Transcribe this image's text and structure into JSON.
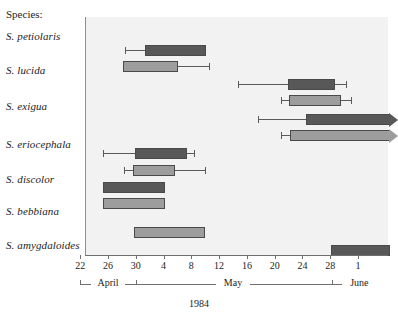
{
  "legend": {
    "species_header": "Species:"
  },
  "axis": {
    "xlabel": "1984",
    "tick_labels": [
      "22",
      "26",
      "30",
      "4",
      "8",
      "12",
      "16",
      "20",
      "24",
      "28",
      "1"
    ],
    "months": [
      {
        "name": "April",
        "start_label": "22",
        "end_label": "30"
      },
      {
        "name": "May",
        "start_label": "1",
        "end_label": "31"
      },
      {
        "name": "June",
        "start_label": "1",
        "end_label": "1"
      }
    ]
  },
  "colors": {
    "dark_bar": "#585858",
    "light_bar": "#9d9d9d",
    "plot_background": "#f2f2f2",
    "axis": "#6f6f6f"
  },
  "chart_data": {
    "type": "bar",
    "title": "",
    "subtitle": "",
    "xlabel": "1984",
    "ylabel": "Species:",
    "xlim": [
      "1984-04-22",
      "1984-06-02"
    ],
    "x_tick_labels": [
      "22",
      "26",
      "30",
      "4",
      "8",
      "12",
      "16",
      "20",
      "24",
      "28",
      "1"
    ],
    "x_tick_days": [
      0,
      4,
      8,
      12,
      16,
      20,
      24,
      28,
      32,
      36,
      40
    ],
    "grid": false,
    "legend_position": "none",
    "note": "Day 0 = April 22, 1984. Two bars per species: upper = dark series, lower = light series. Bars are box ranges; thin lines are whiskers. Arrow = range extends beyond right axis limit.",
    "categories": [
      "S. petiolaris",
      "S. lucida",
      "S. exigua",
      "S. eriocephala",
      "S. discolor",
      "S. bebbiana",
      "S. amygdaloides"
    ],
    "series": [
      {
        "name": "dark",
        "color": "#585858",
        "bars": [
          {
            "category": "S. petiolaris",
            "box_start": 9.2,
            "box_end": 17.9,
            "whisker_low": 6.3,
            "whisker_high": 17.9,
            "arrow_right": false
          },
          {
            "category": "S. lucida",
            "box_start": 29.8,
            "box_end": 36.5,
            "whisker_low": 22.6,
            "whisker_high": 38.2,
            "arrow_right": false
          },
          {
            "category": "S. exigua",
            "box_start": 32.3,
            "box_end": 44.4,
            "whisker_low": 25.5,
            "whisker_high": 44.4,
            "arrow_right": true
          },
          {
            "category": "S. eriocephala",
            "box_start": 7.8,
            "box_end": 15.3,
            "whisker_low": 3.1,
            "whisker_high": 16.2,
            "arrow_right": false
          },
          {
            "category": "S. discolor",
            "box_start": 3.1,
            "box_end": 12.0,
            "whisker_low": null,
            "whisker_high": null,
            "arrow_right": false
          },
          {
            "category": "S. bebbiana",
            "box_start": null,
            "box_end": null,
            "whisker_low": null,
            "whisker_high": null,
            "arrow_right": false
          },
          {
            "category": "S. amygdaloides",
            "box_start": 35.9,
            "box_end": 44.4,
            "whisker_low": null,
            "whisker_high": null,
            "arrow_right": false
          }
        ]
      },
      {
        "name": "light",
        "color": "#9d9d9d",
        "bars": [
          {
            "category": "S. petiolaris",
            "box_start": 6.0,
            "box_end": 13.9,
            "whisker_low": 6.0,
            "whisker_high": 18.4,
            "arrow_right": false
          },
          {
            "category": "S. lucida",
            "box_start": 29.9,
            "box_end": 37.4,
            "whisker_low": 28.7,
            "whisker_high": 38.8,
            "arrow_right": false
          },
          {
            "category": "S. exigua",
            "box_start": 30.1,
            "box_end": 44.4,
            "whisker_low": 28.7,
            "whisker_high": 44.4,
            "arrow_right": true
          },
          {
            "category": "S. eriocephala",
            "box_start": 7.5,
            "box_end": 13.5,
            "whisker_low": 6.1,
            "whisker_high": 17.8,
            "arrow_right": false
          },
          {
            "category": "S. discolor",
            "box_start": 3.1,
            "box_end": 12.0,
            "whisker_low": null,
            "whisker_high": null,
            "arrow_right": false
          },
          {
            "category": "S. bebbiana",
            "box_start": 7.6,
            "box_end": 17.8,
            "whisker_low": null,
            "whisker_high": null,
            "arrow_right": false
          },
          {
            "category": "S. amygdaloides",
            "box_start": null,
            "box_end": null,
            "whisker_low": null,
            "whisker_high": null,
            "arrow_right": false
          }
        ]
      }
    ]
  },
  "layout": {
    "row_label_tops": [
      30,
      64,
      100,
      138,
      173,
      205,
      239
    ],
    "dark_bar_tops": [
      28,
      62,
      97,
      131,
      165,
      0,
      228
    ],
    "light_bar_tops": [
      44,
      78,
      113,
      148,
      181,
      210,
      0
    ]
  }
}
